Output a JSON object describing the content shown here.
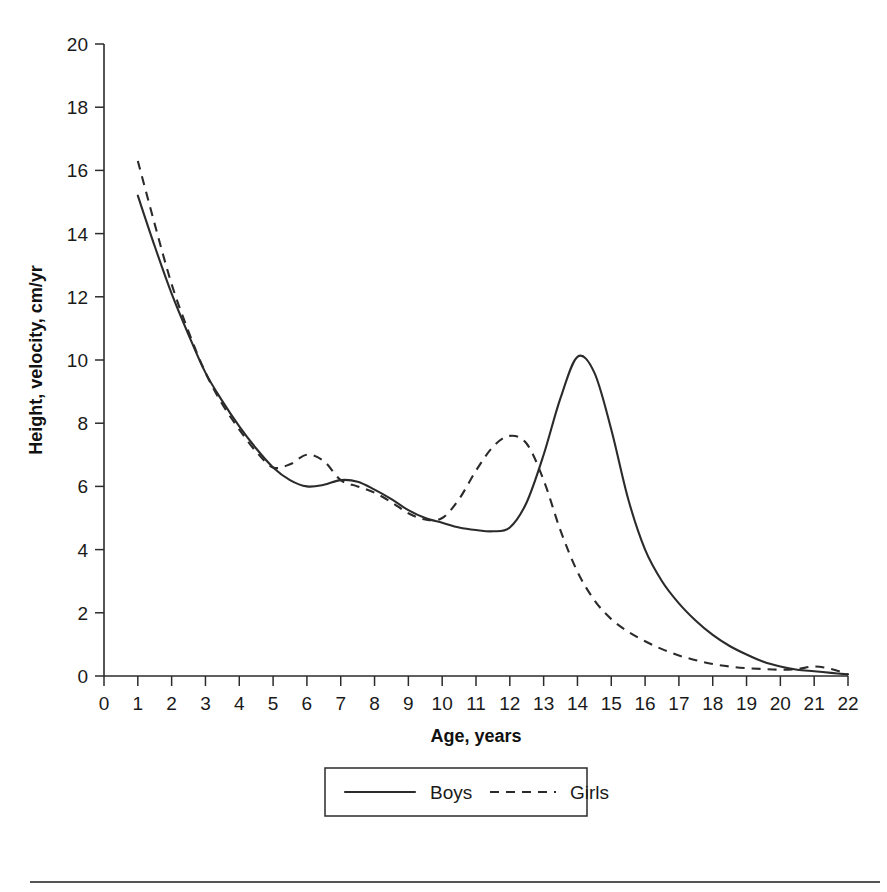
{
  "chart_data": {
    "type": "line",
    "title": "",
    "xlabel": "Age, years",
    "ylabel": "Height, velocity, cm/yr",
    "xlim": [
      0,
      22
    ],
    "ylim": [
      0,
      20
    ],
    "xticks": [
      "0",
      "1",
      "2",
      "3",
      "4",
      "5",
      "6",
      "7",
      "8",
      "9",
      "10",
      "11",
      "12",
      "13",
      "14",
      "15",
      "16",
      "17",
      "18",
      "19",
      "20",
      "21",
      "22"
    ],
    "yticks": [
      "0",
      "2",
      "4",
      "6",
      "8",
      "10",
      "12",
      "14",
      "16",
      "18",
      "20"
    ],
    "grid": false,
    "legend_position": "bottom-center",
    "x": [
      1,
      1.5,
      2,
      2.5,
      3,
      3.5,
      4,
      4.5,
      5,
      5.5,
      6,
      6.5,
      7,
      7.5,
      8,
      8.5,
      9,
      9.5,
      10,
      10.5,
      11,
      11.5,
      12,
      12.5,
      13,
      13.5,
      14,
      14.5,
      15,
      15.5,
      16,
      16.5,
      17,
      17.5,
      18,
      18.5,
      19,
      19.5,
      20,
      20.5,
      21,
      21.5,
      22
    ],
    "series": [
      {
        "name": "Boys",
        "style": "solid",
        "color": "#2b2b2b",
        "values": [
          15.2,
          13.6,
          12.1,
          10.8,
          9.6,
          8.7,
          7.9,
          7.2,
          6.6,
          6.2,
          6.0,
          6.05,
          6.2,
          6.15,
          5.9,
          5.6,
          5.25,
          5.0,
          4.85,
          4.7,
          4.62,
          4.58,
          4.7,
          5.5,
          7.0,
          8.8,
          10.1,
          9.6,
          7.8,
          5.6,
          4.0,
          3.0,
          2.3,
          1.75,
          1.3,
          0.95,
          0.68,
          0.45,
          0.3,
          0.2,
          0.15,
          0.1,
          0.05
        ]
      },
      {
        "name": "Girls",
        "style": "dashed",
        "color": "#2b2b2b",
        "values": [
          16.3,
          14.3,
          12.4,
          10.9,
          9.6,
          8.6,
          7.8,
          7.1,
          6.6,
          6.7,
          7.0,
          6.8,
          6.2,
          6.0,
          5.8,
          5.5,
          5.15,
          4.95,
          5.0,
          5.6,
          6.5,
          7.25,
          7.6,
          7.35,
          6.2,
          4.6,
          3.3,
          2.4,
          1.8,
          1.4,
          1.1,
          0.85,
          0.65,
          0.5,
          0.38,
          0.3,
          0.25,
          0.22,
          0.2,
          0.22,
          0.3,
          0.22,
          0.05
        ]
      }
    ],
    "annotations": [
      {
        "label": "boys-peak-velocity",
        "x": 14,
        "y": 10.1
      },
      {
        "label": "girls-peak-velocity",
        "x": 12,
        "y": 7.6
      },
      {
        "label": "girls-mid-childhood-bump",
        "x": 6,
        "y": 7.0
      },
      {
        "label": "boys-prepubertal-minimum",
        "x": 11.5,
        "y": 4.58
      }
    ]
  },
  "legend": {
    "items": [
      {
        "label": "Boys",
        "style": "solid"
      },
      {
        "label": "Girls",
        "style": "dashed"
      }
    ]
  },
  "axes": {
    "x_title": "Age, years",
    "y_title": "Height, velocity, cm/yr"
  }
}
